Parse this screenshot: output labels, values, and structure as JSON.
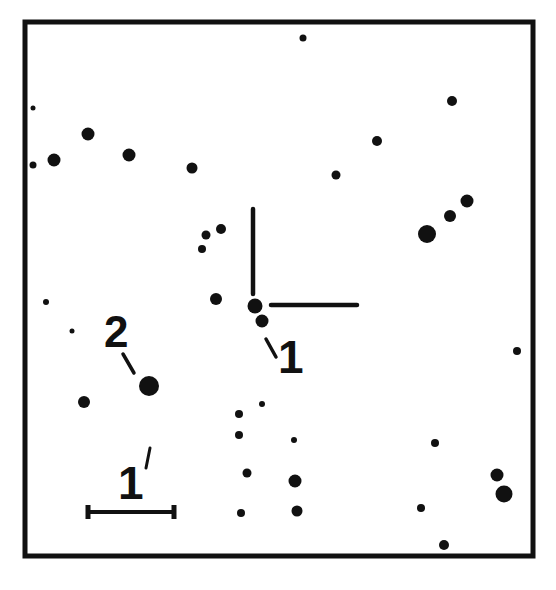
{
  "chart": {
    "type": "finding-chart",
    "frame": {
      "x": 25,
      "y": 22,
      "width": 508,
      "height": 534,
      "stroke": "#111111",
      "stroke_width": 5
    },
    "ink_color": "#111111",
    "background": "#ffffff"
  },
  "labels": {
    "target": "1",
    "comparison": "2",
    "scale": "1",
    "scale_unit": "′"
  },
  "crosshair": {
    "target_star": {
      "x": 255,
      "y": 306
    },
    "vertical": {
      "x": 253,
      "y1": 209,
      "y2": 294
    },
    "horizontal": {
      "y": 305,
      "x1": 271,
      "x2": 357
    }
  },
  "scale_bar": {
    "x1": 88,
    "x2": 175,
    "y": 512,
    "label_x": 120,
    "label_y": 498
  },
  "stars": [
    {
      "x": 303,
      "y": 38,
      "r": 3.5
    },
    {
      "x": 33,
      "y": 108,
      "r": 2.5
    },
    {
      "x": 452,
      "y": 101,
      "r": 5
    },
    {
      "x": 88,
      "y": 134,
      "r": 6.5
    },
    {
      "x": 377,
      "y": 141,
      "r": 5
    },
    {
      "x": 33,
      "y": 165,
      "r": 3.5
    },
    {
      "x": 54,
      "y": 160,
      "r": 6.5
    },
    {
      "x": 129,
      "y": 155,
      "r": 6.5
    },
    {
      "x": 192,
      "y": 168,
      "r": 5.5
    },
    {
      "x": 336,
      "y": 175,
      "r": 4.5
    },
    {
      "x": 467,
      "y": 201,
      "r": 6.5
    },
    {
      "x": 450,
      "y": 216,
      "r": 6
    },
    {
      "x": 427,
      "y": 234,
      "r": 9
    },
    {
      "x": 221,
      "y": 229,
      "r": 5
    },
    {
      "x": 206,
      "y": 235,
      "r": 4.5
    },
    {
      "x": 202,
      "y": 249,
      "r": 4
    },
    {
      "x": 216,
      "y": 299,
      "r": 6
    },
    {
      "x": 255,
      "y": 306,
      "r": 7.5
    },
    {
      "x": 262,
      "y": 321,
      "r": 6.5
    },
    {
      "x": 46,
      "y": 302,
      "r": 3
    },
    {
      "x": 72,
      "y": 331,
      "r": 2.5
    },
    {
      "x": 517,
      "y": 351,
      "r": 4
    },
    {
      "x": 149,
      "y": 386,
      "r": 10
    },
    {
      "x": 84,
      "y": 402,
      "r": 6
    },
    {
      "x": 262,
      "y": 404,
      "r": 3
    },
    {
      "x": 239,
      "y": 414,
      "r": 4
    },
    {
      "x": 239,
      "y": 435,
      "r": 4
    },
    {
      "x": 294,
      "y": 440,
      "r": 3
    },
    {
      "x": 435,
      "y": 443,
      "r": 4
    },
    {
      "x": 247,
      "y": 473,
      "r": 4.5
    },
    {
      "x": 295,
      "y": 481,
      "r": 6.5
    },
    {
      "x": 497,
      "y": 475,
      "r": 6.5
    },
    {
      "x": 504,
      "y": 494,
      "r": 8.5
    },
    {
      "x": 241,
      "y": 513,
      "r": 4
    },
    {
      "x": 297,
      "y": 511,
      "r": 5.5
    },
    {
      "x": 421,
      "y": 508,
      "r": 4
    },
    {
      "x": 444,
      "y": 545,
      "r": 5
    }
  ]
}
